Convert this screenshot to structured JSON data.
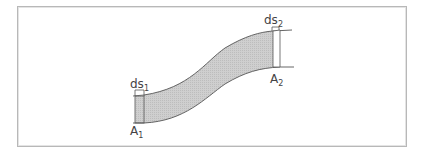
{
  "diagram": {
    "labels": {
      "ds1": {
        "main": "ds",
        "sub": "1"
      },
      "ds2": {
        "main": "ds",
        "sub": "2"
      },
      "A1": {
        "main": "A",
        "sub": "1"
      },
      "A2": {
        "main": "A",
        "sub": "2"
      }
    },
    "colors": {
      "tube_fill": "#c8c8c8",
      "stroke": "#555555",
      "frame": "#b8b8b8"
    }
  }
}
